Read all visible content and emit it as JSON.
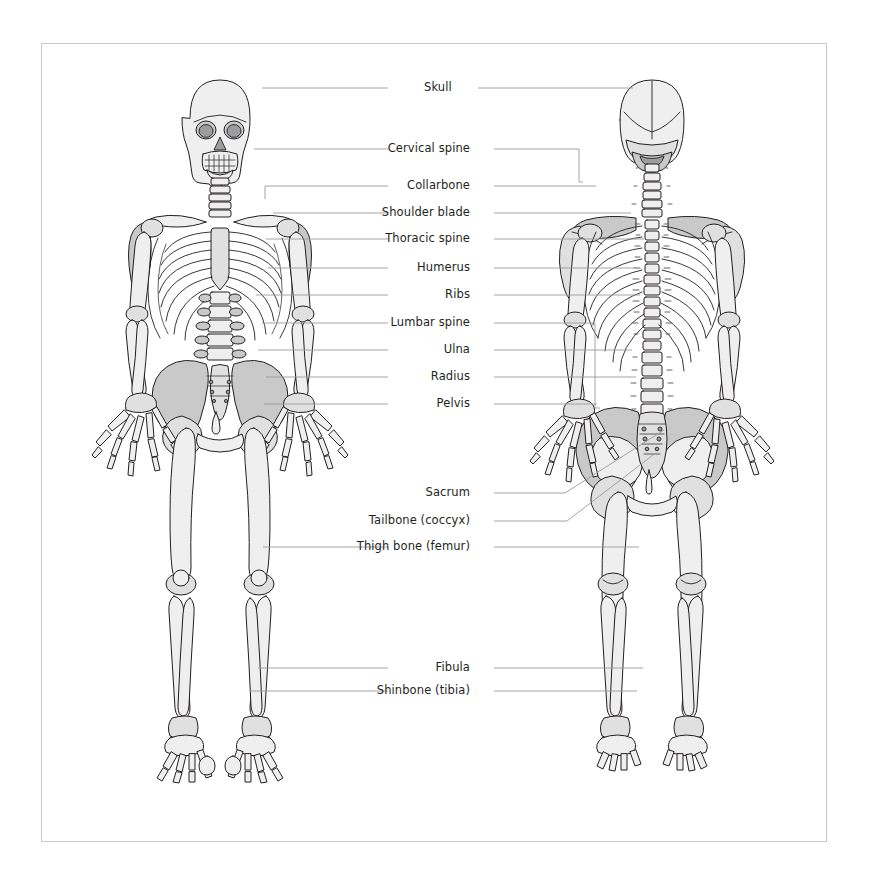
{
  "diagram": {
    "views": [
      {
        "name": "anterior-view",
        "caption": "Front view"
      },
      {
        "name": "posterior-view",
        "caption": "Back view"
      }
    ],
    "colors": {
      "frame_border": "#c9c9c9",
      "background": "#ffffff",
      "label_text": "#231f20",
      "leader_line": "#9a9a9a",
      "bone_light": "#efeff0",
      "bone_mid": "#e0e0e1",
      "bone_dark": "#c9c9ca",
      "bone_outline": "#231f20"
    },
    "labels": [
      {
        "id": "skull",
        "text": "Skull",
        "x": 424,
        "y": 88,
        "align": "left"
      },
      {
        "id": "cervical",
        "text": "Cervical spine",
        "x": 470,
        "y": 149,
        "align": "right"
      },
      {
        "id": "collarbone",
        "text": "Collarbone",
        "x": 470,
        "y": 186,
        "align": "right"
      },
      {
        "id": "shoulder",
        "text": "Shoulder blade",
        "x": 470,
        "y": 213,
        "align": "right"
      },
      {
        "id": "thoracic",
        "text": "Thoracic spine",
        "x": 470,
        "y": 239,
        "align": "right"
      },
      {
        "id": "humerus",
        "text": "Humerus",
        "x": 470,
        "y": 268,
        "align": "right"
      },
      {
        "id": "ribs",
        "text": "Ribs",
        "x": 470,
        "y": 295,
        "align": "right"
      },
      {
        "id": "lumbar",
        "text": "Lumbar spine",
        "x": 470,
        "y": 323,
        "align": "right"
      },
      {
        "id": "ulna",
        "text": "Ulna",
        "x": 470,
        "y": 350,
        "align": "right"
      },
      {
        "id": "radius",
        "text": "Radius",
        "x": 470,
        "y": 377,
        "align": "right"
      },
      {
        "id": "pelvis",
        "text": "Pelvis",
        "x": 470,
        "y": 404,
        "align": "right"
      },
      {
        "id": "sacrum",
        "text": "Sacrum",
        "x": 470,
        "y": 493,
        "align": "right"
      },
      {
        "id": "tailbone",
        "text": "Tailbone (coccyx)",
        "x": 470,
        "y": 521,
        "align": "right"
      },
      {
        "id": "femur",
        "text": "Thigh bone (femur)",
        "x": 470,
        "y": 547,
        "align": "right"
      },
      {
        "id": "fibula",
        "text": "Fibula",
        "x": 470,
        "y": 668,
        "align": "right"
      },
      {
        "id": "tibia",
        "text": "Shinbone (tibia)",
        "x": 470,
        "y": 691,
        "align": "right"
      }
    ],
    "leader_lines": [
      {
        "id": "skull-left",
        "points": "388,88 262,88"
      },
      {
        "id": "skull-right",
        "points": "478,88 633,88"
      },
      {
        "id": "cervical-left",
        "points": "388,149 254,149"
      },
      {
        "id": "cervical-bracket",
        "points": "494,149 579,149 579,182 583,182"
      },
      {
        "id": "collarbone-left",
        "points": "388,186 265,186 265,199"
      },
      {
        "id": "collarbone-right",
        "points": "494,186 596,186"
      },
      {
        "id": "shoulder-left",
        "points": "388,213 273,213"
      },
      {
        "id": "shoulder-right",
        "points": "494,213 631,213"
      },
      {
        "id": "thoracic-left",
        "points": "388,239 266,239"
      },
      {
        "id": "thoracic-right",
        "points": "494,239 644,239"
      },
      {
        "id": "humerus-left",
        "points": "388,268 268,268"
      },
      {
        "id": "humerus-right",
        "points": "494,268 637,268"
      },
      {
        "id": "ribs-left",
        "points": "388,295 256,295"
      },
      {
        "id": "ribs-right",
        "points": "494,295 640,295"
      },
      {
        "id": "lumbar-left",
        "points": "388,323 262,323"
      },
      {
        "id": "lumbar-bracket",
        "points": "494,323 595,323 595,408 600,408"
      },
      {
        "id": "ulna-left",
        "points": "388,350 258,350"
      },
      {
        "id": "ulna-right",
        "points": "494,350 632,350"
      },
      {
        "id": "radius-left",
        "points": "388,377 266,377"
      },
      {
        "id": "radius-right",
        "points": "494,377 636,377"
      },
      {
        "id": "pelvis-left",
        "points": "388,404 264,404"
      },
      {
        "id": "pelvis-right",
        "points": "494,404 597,404"
      },
      {
        "id": "sacrum-leader",
        "points": "494,493 565,493 664,430"
      },
      {
        "id": "tailbone-leader",
        "points": "494,521 567,521 653,455"
      },
      {
        "id": "femur-left",
        "points": "388,547 263,547"
      },
      {
        "id": "femur-right",
        "points": "494,547 639,547"
      },
      {
        "id": "fibula-left",
        "points": "388,668 258,668"
      },
      {
        "id": "fibula-right",
        "points": "494,668 643,668"
      },
      {
        "id": "tibia-left",
        "points": "388,691 250,691"
      },
      {
        "id": "tibia-right",
        "points": "494,691 637,691"
      }
    ]
  }
}
